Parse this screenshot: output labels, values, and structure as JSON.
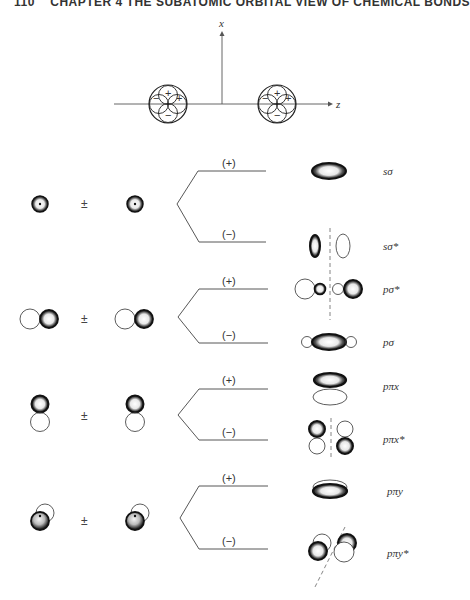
{
  "header": {
    "page_number": "110",
    "running_title": "CHAPTER 4  THE SUBATOMIC ORBITAL VIEW OF CHEMICAL BONDS"
  },
  "axes": {
    "x_label": "x",
    "z_label": "z",
    "left_atom_signs": [
      "+",
      "−",
      "+",
      "−"
    ],
    "right_atom_signs": [
      "+",
      "−",
      "+",
      "−"
    ]
  },
  "combination_symbol": "±",
  "rows": [
    {
      "id": "s",
      "atomic_orbital": "s",
      "upper_sign": "(+)",
      "lower_sign": "(−)",
      "upper_mo": "sσ",
      "lower_mo": "sσ*"
    },
    {
      "id": "p-sigma",
      "atomic_orbital": "pz",
      "upper_sign": "(+)",
      "lower_sign": "(−)",
      "upper_mo": "pσ*",
      "lower_mo": "pσ"
    },
    {
      "id": "p-pi-x",
      "atomic_orbital": "px",
      "upper_sign": "(+)",
      "lower_sign": "(−)",
      "upper_mo": "pπx",
      "lower_mo": "pπx*"
    },
    {
      "id": "p-pi-y",
      "atomic_orbital": "py",
      "upper_sign": "(+)",
      "lower_sign": "(−)",
      "upper_mo": "pπy",
      "lower_mo": "pπy*"
    }
  ]
}
